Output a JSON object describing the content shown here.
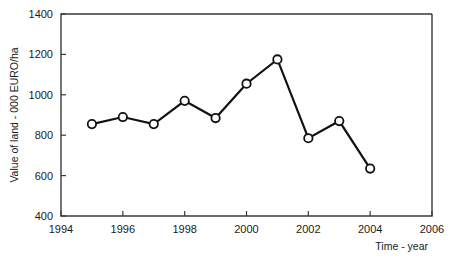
{
  "chart_data": {
    "type": "line",
    "title": "",
    "xlabel": "Time - year",
    "ylabel": "Value of land - 000 EURO/ha",
    "xlim": [
      1994,
      2006
    ],
    "ylim": [
      400,
      1400
    ],
    "xticks": [
      1994,
      1996,
      1998,
      2000,
      2002,
      2004,
      2006
    ],
    "yticks": [
      400,
      600,
      800,
      1000,
      1200,
      1400
    ],
    "grid": false,
    "legend": false,
    "marker": "open-circle",
    "line_color": "#111111",
    "marker_fill": "#ffffff",
    "x": [
      1995,
      1996,
      1997,
      1998,
      1999,
      2000,
      2001,
      2002,
      2003,
      2004
    ],
    "values": [
      855,
      890,
      855,
      970,
      885,
      1055,
      1175,
      785,
      870,
      635
    ],
    "series": [
      {
        "name": "Value of land",
        "x": [
          1995,
          1996,
          1997,
          1998,
          1999,
          2000,
          2001,
          2002,
          2003,
          2004
        ],
        "values": [
          855,
          890,
          855,
          970,
          885,
          1055,
          1175,
          785,
          870,
          635
        ]
      }
    ]
  },
  "axes": {
    "x_tick_labels": [
      "1994",
      "1996",
      "1998",
      "2000",
      "2002",
      "2004",
      "2006"
    ],
    "y_tick_labels": [
      "400",
      "600",
      "800",
      "1000",
      "1200",
      "1400"
    ],
    "x_axis_title": "Time - year",
    "y_axis_title": "Value of land - 000 EURO/ha"
  }
}
